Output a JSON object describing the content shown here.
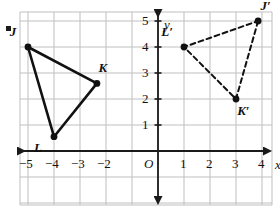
{
  "figure": {
    "bullet": "▪",
    "colors": {
      "grid": "#bfbfbf",
      "axis": "#1a1a1a",
      "shape": "#111111",
      "background": "#ffffff"
    }
  },
  "axes": {
    "x_axis_label": "x",
    "y_axis_label": "y",
    "origin_label": "O",
    "x_ticks_negative": [
      "−5",
      "−4",
      "−3",
      "−2"
    ],
    "x_ticks_positive": [
      "1",
      "2",
      "3",
      "4"
    ],
    "y_ticks": [
      "1",
      "2",
      "3",
      "4",
      "5"
    ],
    "x_range": [
      -6,
      5
    ],
    "y_range": [
      -2,
      6
    ],
    "grid": true,
    "grid_spacing": 1
  },
  "chart_data": {
    "type": "scatter",
    "title": "",
    "xlabel": "x",
    "ylabel": "y",
    "xlim": [
      -6,
      5
    ],
    "ylim": [
      -2,
      6
    ],
    "grid": true,
    "series": [
      {
        "name": "Triangle JKL",
        "style": "solid",
        "closed": true,
        "points": [
          {
            "label": "J",
            "x": -5,
            "y": 4,
            "label_dx": -0.55,
            "label_dy": 0.62
          },
          {
            "label": "K",
            "x": -2.35,
            "y": 2.6,
            "label_dx": 0.22,
            "label_dy": 0.62
          },
          {
            "label": "L",
            "x": -4,
            "y": 0.55,
            "label_dx": -0.62,
            "label_dy": -0.38
          }
        ]
      },
      {
        "name": "Triangle J'K'L'",
        "style": "dashed",
        "closed": true,
        "points": [
          {
            "label": "J′",
            "x": 3.85,
            "y": 5,
            "label_dx": 0.25,
            "label_dy": 0.6
          },
          {
            "label": "K′",
            "x": 3,
            "y": 2,
            "label_dx": 0.2,
            "label_dy": -0.42
          },
          {
            "label": "L′",
            "x": 1,
            "y": 4,
            "label_dx": -0.72,
            "label_dy": 0.62
          }
        ]
      }
    ]
  }
}
